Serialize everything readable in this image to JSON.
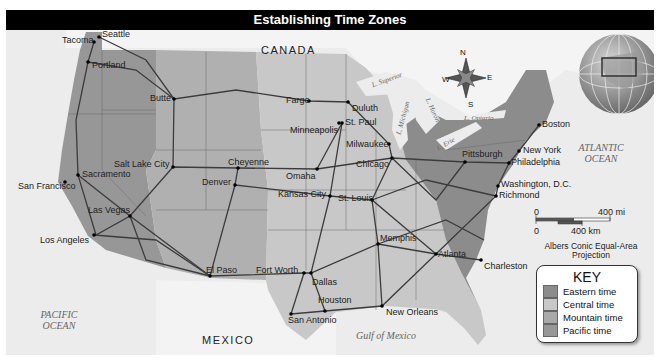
{
  "title": "Establishing Time Zones",
  "regions": {
    "canada": "CANADA",
    "mexico": "MEXICO",
    "pacific": "PACIFIC OCEAN",
    "atlantic": "ATLANTIC OCEAN",
    "gulf": "Gulf of Mexico"
  },
  "lakes": {
    "superior": "L. Superior",
    "michigan": "L. Michigan",
    "huron": "L. Huron",
    "ontario": "L. Ontario",
    "erie": "L. Erie"
  },
  "compass": {
    "n": "N",
    "s": "S",
    "e": "E",
    "w": "W"
  },
  "cities": [
    {
      "name": "Seattle",
      "x": 93,
      "y": 27
    },
    {
      "name": "Tacoma",
      "x": 88,
      "y": 32
    },
    {
      "name": "Portland",
      "x": 82,
      "y": 52
    },
    {
      "name": "Butte",
      "x": 168,
      "y": 89
    },
    {
      "name": "Salt Lake City",
      "x": 167,
      "y": 157
    },
    {
      "name": "Sacramento",
      "x": 72,
      "y": 165
    },
    {
      "name": "San Francisco",
      "x": 59,
      "y": 172
    },
    {
      "name": "Las Vegas",
      "x": 124,
      "y": 206
    },
    {
      "name": "Los Angeles",
      "x": 88,
      "y": 225
    },
    {
      "name": "El Paso",
      "x": 204,
      "y": 266
    },
    {
      "name": "Cheyenne",
      "x": 232,
      "y": 158
    },
    {
      "name": "Denver",
      "x": 229,
      "y": 175
    },
    {
      "name": "Fargo",
      "x": 303,
      "y": 91
    },
    {
      "name": "Duluth",
      "x": 342,
      "y": 92
    },
    {
      "name": "St. Paul",
      "x": 336,
      "y": 113
    },
    {
      "name": "Minneapolis",
      "x": 333,
      "y": 113
    },
    {
      "name": "Milwaukee",
      "x": 383,
      "y": 134
    },
    {
      "name": "Chicago",
      "x": 386,
      "y": 148
    },
    {
      "name": "Omaha",
      "x": 311,
      "y": 159
    },
    {
      "name": "Kansas City",
      "x": 324,
      "y": 186
    },
    {
      "name": "St. Louis",
      "x": 366,
      "y": 190
    },
    {
      "name": "Memphis",
      "x": 372,
      "y": 234
    },
    {
      "name": "Fort Worth",
      "x": 298,
      "y": 263
    },
    {
      "name": "Dallas",
      "x": 305,
      "y": 263
    },
    {
      "name": "Houston",
      "x": 319,
      "y": 301
    },
    {
      "name": "San Antonio",
      "x": 285,
      "y": 304
    },
    {
      "name": "New Orleans",
      "x": 376,
      "y": 296
    },
    {
      "name": "Atlanta",
      "x": 430,
      "y": 244
    },
    {
      "name": "Charleston",
      "x": 475,
      "y": 250
    },
    {
      "name": "Pittsburgh",
      "x": 459,
      "y": 152
    },
    {
      "name": "New York",
      "x": 513,
      "y": 141
    },
    {
      "name": "Philadelphia",
      "x": 503,
      "y": 153
    },
    {
      "name": "Washington, D.C.",
      "x": 492,
      "y": 176
    },
    {
      "name": "Richmond",
      "x": 490,
      "y": 186
    },
    {
      "name": "Boston",
      "x": 533,
      "y": 115
    }
  ],
  "scale": {
    "mi_zero": "0",
    "mi_label": "400 mi",
    "km_zero": "0",
    "km_label": "400 km",
    "projection_line1": "Albers Conic Equal-Area",
    "projection_line2": "Projection"
  },
  "key": {
    "title": "KEY",
    "items": [
      {
        "label": "Eastern time",
        "color": "#8c8c8c"
      },
      {
        "label": "Central time",
        "color": "#c8c8c8"
      },
      {
        "label": "Mountain time",
        "color": "#a9a9a9"
      },
      {
        "label": "Pacific time",
        "color": "#979797"
      }
    ]
  },
  "colors": {
    "eastern": "#8c8c8c",
    "central": "#c8c8c8",
    "mountain": "#b0b0b0",
    "pacific": "#979797",
    "water": "#ececec",
    "land_foreign": "#f2f2f2",
    "rail": "#3c3c3c"
  }
}
